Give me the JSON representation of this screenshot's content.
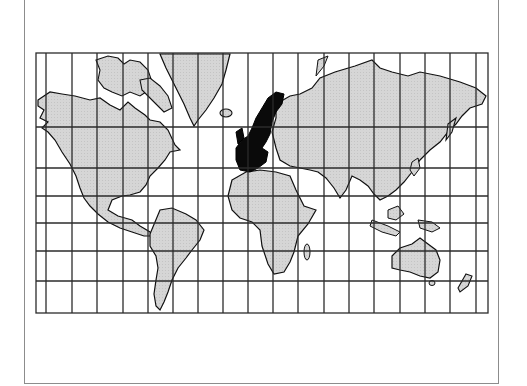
{
  "figure": {
    "title": "",
    "projection": "Mercator",
    "highlighted_region": "Europe"
  },
  "colors": {
    "frame": "#8c8c8c",
    "grid": "#2b2b2b",
    "land": "#d4d4d4",
    "coast": "#111111",
    "highlight": "#0a0a0a",
    "ocean": "#ffffff"
  },
  "map": {
    "box": {
      "x0": 36,
      "y0": 53,
      "x1": 488,
      "y1": 313
    },
    "meridians_x": [
      46,
      72,
      97,
      123,
      148,
      173,
      198,
      223,
      248,
      273,
      298,
      324,
      349,
      374,
      400,
      425,
      450,
      476
    ],
    "parallels_y": [
      127,
      168,
      196,
      223,
      251,
      281
    ],
    "landmasses": [
      "North America",
      "Greenland",
      "South America",
      "Europe",
      "Africa",
      "Asia",
      "Australia",
      "New Zealand",
      "Madagascar",
      "Iceland",
      "Indonesia",
      "Japan",
      "Arctic Archipelago"
    ]
  }
}
